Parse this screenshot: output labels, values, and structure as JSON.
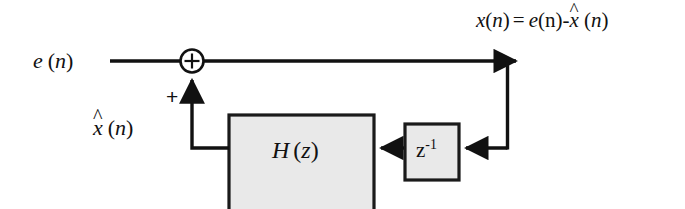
{
  "diagram": {
    "type": "signal-flow-block-diagram",
    "background_color": "#ffffff",
    "line_color": "#111111",
    "block_fill_color": "#e9e9e9",
    "block_border_color": "#1a1a1a",
    "input_label": {
      "symbol": "e",
      "argument": "n",
      "full_text": "e (n)"
    },
    "output_equation": {
      "lhs_symbol": "x",
      "lhs_argument": "n",
      "equals": "=",
      "term1_symbol": "e",
      "term1_argument": "n",
      "minus": "-",
      "term2_symbol": "x",
      "term2_hat": "^",
      "term2_argument": "n",
      "full_text": "x(n) = e(n)-x̂ (n)"
    },
    "feedback_label": {
      "symbol": "x",
      "hat": "^",
      "argument": "n",
      "full_text": "x̂ (n)"
    },
    "summing_junction": {
      "operator": "+",
      "input_sign": "+",
      "shape": "circle"
    },
    "filter_block": {
      "symbol": "H",
      "argument": "z",
      "full_text": "H (z)"
    },
    "delay_block": {
      "symbol": "z",
      "exponent": "-1",
      "full_text": "z⁻¹"
    }
  }
}
